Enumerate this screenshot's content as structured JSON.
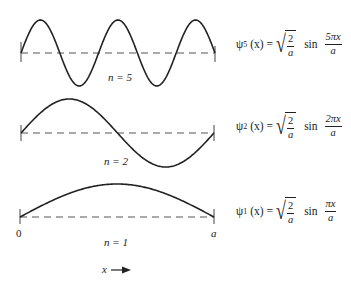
{
  "figure": {
    "panels": [
      {
        "n": 5,
        "label": "n = 5",
        "equation": {
          "psi": "ψ",
          "subscript": "5",
          "arg": "(x) =",
          "sqrt_num": "2",
          "sqrt_den": "a",
          "sin": "sin",
          "frac_num": "5πx",
          "frac_den": "a"
        }
      },
      {
        "n": 2,
        "label": "n = 2",
        "equation": {
          "psi": "ψ",
          "subscript": "2",
          "arg": "(x) =",
          "sqrt_num": "2",
          "sqrt_den": "a",
          "sin": "sin",
          "frac_num": "2πx",
          "frac_den": "a"
        }
      },
      {
        "n": 1,
        "label": "n = 1",
        "equation": {
          "psi": "ψ",
          "subscript": "1",
          "arg": "(x) =",
          "sqrt_num": "2",
          "sqrt_den": "a",
          "sin": "sin",
          "frac_num": "πx",
          "frac_den": "a"
        }
      }
    ],
    "axis": {
      "left_label": "0",
      "right_label": "a",
      "x_arrow_label": "x"
    },
    "colors": {
      "curve": "#222222",
      "baseline": "#555555"
    }
  }
}
